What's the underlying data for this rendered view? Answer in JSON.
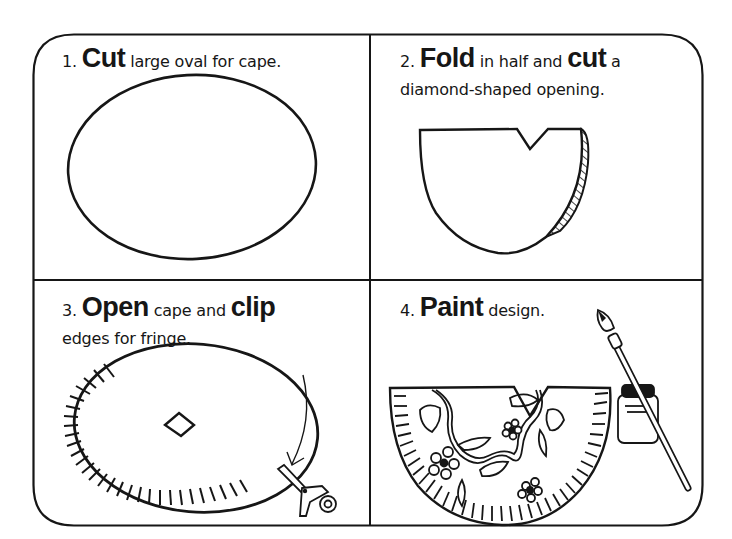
{
  "colors": {
    "ink": "#161616",
    "background": "#ffffff",
    "hatch": "#161616"
  },
  "steps": [
    {
      "number": "1.",
      "verb": "Cut",
      "text": "large oval for cape.",
      "illustration": "oval-outline"
    },
    {
      "number": "2.",
      "verb": "Fold",
      "text_mid": "in half and",
      "verb2": "cut",
      "text_end": "a",
      "line2": "diamond-shaped opening.",
      "illustration": "folded-half-oval-with-notch"
    },
    {
      "number": "3.",
      "verb": "Open",
      "text_mid": "cape and",
      "verb2": "clip",
      "line2": "edges for fringe.",
      "illustration": "oval-with-fringe-diamond-hole-scissors-arrow"
    },
    {
      "number": "4.",
      "verb": "Paint",
      "text": "design.",
      "illustration": "painted-cape-with-flowers-brush-paint-jar"
    }
  ]
}
